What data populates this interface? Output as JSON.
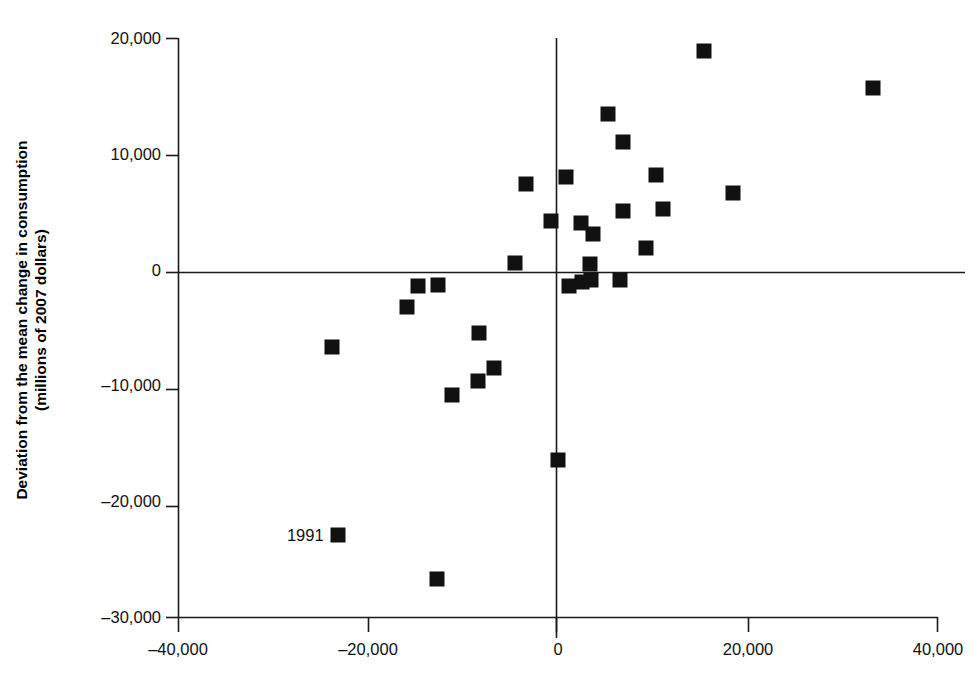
{
  "chart_data": {
    "type": "scatter",
    "title": "",
    "subtitle": "",
    "xlabel": "",
    "ylabel": "Deviation from the mean change in consumption (millions of 2007 dollars)",
    "ylabel_line1": "Deviation from the mean change in consumption",
    "ylabel_line2": "(millions of 2007 dollars)",
    "xlim": [
      -40000,
      40000
    ],
    "ylim": [
      -30000,
      20000
    ],
    "xticks": [
      -40000,
      -20000,
      0,
      20000,
      40000
    ],
    "xtick_labels": [
      "–40,000",
      "–20,000",
      "0",
      "20,000",
      "40,000"
    ],
    "yticks": [
      20000,
      10000,
      0,
      -10000,
      -20000,
      -30000
    ],
    "ytick_labels": [
      "20,000",
      "10,000",
      "0",
      "–10,000",
      "–20,000",
      "–30,000"
    ],
    "grid": false,
    "legend": null,
    "marker": "square",
    "marker_color": "#111111",
    "series": [
      {
        "name": "observations",
        "points": [
          {
            "x": 15400,
            "y": 18900
          },
          {
            "x": 33200,
            "y": 15700
          },
          {
            "x": 5300,
            "y": 13400
          },
          {
            "x": 6800,
            "y": 11000
          },
          {
            "x": -3400,
            "y": 7400
          },
          {
            "x": 800,
            "y": 8000
          },
          {
            "x": 10300,
            "y": 8200
          },
          {
            "x": 18400,
            "y": 6600
          },
          {
            "x": -700,
            "y": 4200
          },
          {
            "x": 2400,
            "y": 4000
          },
          {
            "x": 6800,
            "y": 5100
          },
          {
            "x": 11100,
            "y": 5200
          },
          {
            "x": 3700,
            "y": 3100
          },
          {
            "x": 9300,
            "y": 1900
          },
          {
            "x": -4500,
            "y": 600
          },
          {
            "x": 3400,
            "y": 500
          },
          {
            "x": 1200,
            "y": -1400
          },
          {
            "x": 2500,
            "y": -1100
          },
          {
            "x": 3500,
            "y": -900
          },
          {
            "x": 6500,
            "y": -900
          },
          {
            "x": -12600,
            "y": -1300
          },
          {
            "x": -14700,
            "y": -1400
          },
          {
            "x": -15900,
            "y": -3200
          },
          {
            "x": -8300,
            "y": -5500
          },
          {
            "x": -23800,
            "y": -6700
          },
          {
            "x": -6700,
            "y": -8500
          },
          {
            "x": -8400,
            "y": -9600
          },
          {
            "x": -11200,
            "y": -10800
          },
          {
            "x": 0,
            "y": -16400
          },
          {
            "x": -23200,
            "y": -22900
          },
          {
            "x": -12700,
            "y": -26700
          }
        ]
      }
    ],
    "annotations": [
      {
        "text": "1991",
        "x": -23200,
        "y": -22900,
        "offset_px": -14
      }
    ]
  },
  "axes_geometry": {
    "x_px_at_min": 178,
    "x_px_at_max": 938,
    "y_px_at_min": 617,
    "y_px_at_max": 38
  }
}
